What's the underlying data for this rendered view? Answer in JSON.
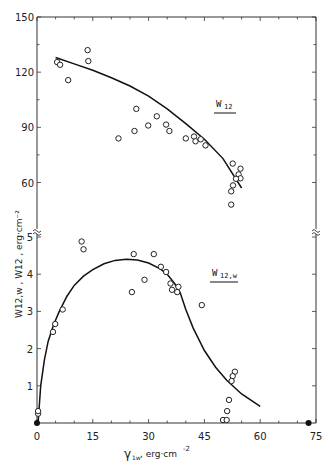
{
  "chart_data": {
    "type": "scatter",
    "title": "",
    "xlabel": "γ1w, erg·cm⁻²",
    "ylabel": "W12,w , W12 , erg·cm⁻²",
    "x_ticks": [
      0,
      15,
      30,
      45,
      60,
      75
    ],
    "xlim": [
      0,
      75
    ],
    "grid": false,
    "legend_position": "inline labels",
    "panels": [
      {
        "name": "upper",
        "series_label": "W12",
        "ylim": [
          48,
          150
        ],
        "y_ticks": [
          60,
          90,
          120,
          150
        ],
        "points": [
          [
            5.4,
            125.5
          ],
          [
            6.2,
            124
          ],
          [
            8.4,
            115.7
          ],
          [
            13.6,
            132
          ],
          [
            13.8,
            126
          ],
          [
            21.9,
            84
          ],
          [
            26.2,
            88
          ],
          [
            26.7,
            100
          ],
          [
            29.9,
            91
          ],
          [
            32.2,
            96
          ],
          [
            34.7,
            91.5
          ],
          [
            35.6,
            88
          ],
          [
            40.0,
            84
          ],
          [
            42.2,
            85
          ],
          [
            42.6,
            82.4
          ],
          [
            44.0,
            83.5
          ],
          [
            45.3,
            80.2
          ],
          [
            52.6,
            70.3
          ],
          [
            54.7,
            67.5
          ],
          [
            54.2,
            64.4
          ],
          [
            54.7,
            62.3
          ],
          [
            53.5,
            62
          ],
          [
            52.7,
            58.4
          ],
          [
            52.2,
            55.2
          ],
          [
            52.2,
            48
          ]
        ],
        "fit_curve": [
          [
            5,
            128
          ],
          [
            10,
            124.5
          ],
          [
            15,
            121
          ],
          [
            20,
            117
          ],
          [
            25,
            112.5
          ],
          [
            30,
            107
          ],
          [
            35,
            100
          ],
          [
            40,
            92
          ],
          [
            45,
            83.5
          ],
          [
            50,
            73
          ],
          [
            55,
            57
          ]
        ]
      },
      {
        "name": "lower",
        "series_label": "W12,w",
        "ylim": [
          0,
          5.3
        ],
        "y_ticks": [
          1,
          2,
          3,
          4,
          5
        ],
        "points": [
          [
            0.3,
            0.25
          ],
          [
            0.3,
            0.32
          ],
          [
            4.3,
            2.45
          ],
          [
            4.9,
            2.66
          ],
          [
            6.9,
            3.05
          ],
          [
            12.0,
            4.88
          ],
          [
            12.5,
            4.67
          ],
          [
            26.0,
            4.54
          ],
          [
            25.5,
            3.52
          ],
          [
            28.9,
            3.85
          ],
          [
            31.4,
            4.54
          ],
          [
            33.3,
            4.2
          ],
          [
            34.7,
            4.06
          ],
          [
            35.9,
            3.75
          ],
          [
            36.3,
            3.58
          ],
          [
            38.0,
            3.66
          ],
          [
            37.7,
            3.52
          ],
          [
            44.3,
            3.17
          ],
          [
            53.2,
            1.38
          ],
          [
            52.6,
            1.26
          ],
          [
            52.3,
            1.13
          ],
          [
            51.6,
            0.62
          ],
          [
            51.1,
            0.32
          ],
          [
            50.0,
            0.08
          ],
          [
            51.0,
            0.08
          ]
        ],
        "fit_curve": [
          [
            0.3,
            0
          ],
          [
            1,
            1.0
          ],
          [
            2,
            1.7
          ],
          [
            3,
            2.2
          ],
          [
            4.5,
            2.65
          ],
          [
            6,
            3.0
          ],
          [
            8,
            3.4
          ],
          [
            10,
            3.7
          ],
          [
            12.5,
            3.95
          ],
          [
            15,
            4.12
          ],
          [
            18,
            4.28
          ],
          [
            21,
            4.37
          ],
          [
            24,
            4.4
          ],
          [
            27,
            4.38
          ],
          [
            30,
            4.3
          ],
          [
            33,
            4.15
          ],
          [
            35,
            4.0
          ],
          [
            37,
            3.75
          ],
          [
            38.5,
            3.5
          ],
          [
            40,
            3.05
          ],
          [
            42,
            2.55
          ],
          [
            45,
            1.95
          ],
          [
            48,
            1.5
          ],
          [
            51,
            1.15
          ],
          [
            55,
            0.78
          ],
          [
            60,
            0.45
          ]
        ]
      }
    ],
    "markers_on_x_axis": [
      [
        0,
        0
      ],
      [
        73,
        0
      ]
    ],
    "axis_break_value_label": "≈"
  },
  "labels": {
    "x_axis_symbol": "γ",
    "x_axis_subscript": "1w",
    "x_axis_unit": ", erg·cm",
    "x_axis_exp": "-2",
    "y_axis_text": "W12,w , W12 , erg·cm⁻²",
    "upper_series": "W12",
    "upper_series_main": "W",
    "upper_series_sub": "12",
    "lower_series_main": "W",
    "lower_series_sub": "12,w",
    "x_tick_labels": [
      "0",
      "15",
      "30",
      "45",
      "60",
      "75"
    ],
    "upper_y_tick_labels": [
      "60",
      "90",
      "120",
      "150"
    ],
    "lower_y_tick_labels": [
      "1",
      "2",
      "3",
      "4",
      "5"
    ]
  }
}
